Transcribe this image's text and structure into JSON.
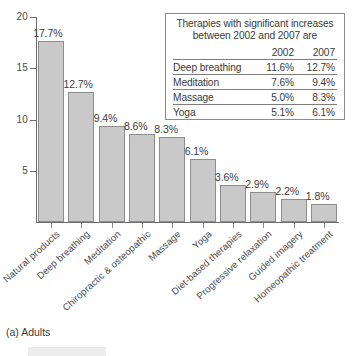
{
  "caption": "(a) Adults",
  "chart_data": {
    "type": "bar",
    "title": "",
    "subtitle": "",
    "xlabel": "",
    "ylabel": "",
    "ylim": [
      0,
      20
    ],
    "yticks": [
      5,
      10,
      15,
      20
    ],
    "grid": false,
    "legend": "none",
    "categories": [
      "Natural products",
      "Deep breathing",
      "Meditation",
      "Chiropractic & osteopathic",
      "Massage",
      "Yoga",
      "Diet-based therapies",
      "Progressive relaxation",
      "Guided imagery",
      "Homeopathic treatment"
    ],
    "values": [
      17.7,
      12.7,
      9.4,
      8.6,
      8.3,
      6.1,
      3.6,
      2.9,
      2.2,
      1.8
    ],
    "value_labels": [
      "17.7%",
      "12.7%",
      "9.4%",
      "8.6%",
      "8.3%",
      "6.1%",
      "3.6%",
      "2.9%",
      "2.2%",
      "1.8%"
    ],
    "bar_color": "#c9c9c9",
    "bar_edge_color": "#8d8d8d"
  },
  "inset_table": {
    "title_line1": "Therapies with significant increases",
    "title_line2": "between 2002 and 2007 are",
    "columns": [
      "",
      "2002",
      "2007"
    ],
    "rows": [
      {
        "name": "Deep breathing",
        "y2002": "11.6%",
        "y2007": "12.7%"
      },
      {
        "name": "Meditation",
        "y2002": "7.6%",
        "y2007": "9.4%"
      },
      {
        "name": "Massage",
        "y2002": "5.0%",
        "y2007": "8.3%"
      },
      {
        "name": "Yoga",
        "y2002": "5.1%",
        "y2007": "6.1%"
      }
    ]
  }
}
